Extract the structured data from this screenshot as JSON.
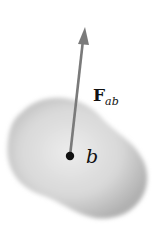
{
  "diagram": {
    "body_label": "b",
    "force_label_main": "F",
    "force_label_sub": "ab",
    "colors": {
      "blob_center": "#e4e4e4",
      "blob_edge": "#b5b5b5",
      "arrow": "#7a7a7a",
      "point": "#111111",
      "text": "#111111"
    }
  }
}
